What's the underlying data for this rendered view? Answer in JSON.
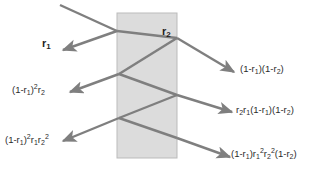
{
  "figure": {
    "slab": {
      "name": "slab",
      "fill_color": "#dcdcdc",
      "border_color": "#bbbbbb",
      "x": 117,
      "y": 13,
      "width": 60,
      "height": 145
    },
    "ray_color": "#7f7f7f",
    "ray_width": 2.4,
    "background_color": "#ffffff"
  },
  "labels": {
    "interface_r2": {
      "text": "r",
      "sub": "2",
      "x": 162,
      "y": 32
    },
    "reflected_1": {
      "text": "r",
      "sub": "1",
      "x": 42,
      "y": 44
    },
    "left_2": {
      "parts": "(1-r1)²r2",
      "x": 14,
      "y": 86
    },
    "left_3": {
      "parts": "(1-r1)²r1r2²",
      "x": 6,
      "y": 136
    },
    "right_1": {
      "parts": "(1-r1)(1-r2)",
      "x": 240,
      "y": 66
    },
    "right_2": {
      "parts": "r2r1(1-r1)(1-r2)",
      "x": 236,
      "y": 107
    },
    "right_3": {
      "parts": "(1-r1)r1²r2²(1-r2)",
      "x": 232,
      "y": 150
    }
  },
  "rays": [
    {
      "name": "incident-ray",
      "points": "60,5 117,31",
      "arrow": false
    },
    {
      "name": "reflected-ray-r1",
      "points": "117,31 63,50",
      "arrow": true
    },
    {
      "name": "refracted-ray-into-slab",
      "points": "117,31 177,38",
      "arrow": false
    },
    {
      "name": "transmitted-ray-1",
      "points": "177,38 234,72",
      "arrow": true
    },
    {
      "name": "internal-ray-back-to-front-1",
      "points": "177,38 119,74",
      "arrow": false
    },
    {
      "name": "exit-ray-left-2",
      "points": "119,74 70,92",
      "arrow": true
    },
    {
      "name": "internal-ray-front-to-back-2",
      "points": "119,74 177,95",
      "arrow": false
    },
    {
      "name": "transmitted-ray-2",
      "points": "177,95 232,112",
      "arrow": true
    },
    {
      "name": "internal-ray-back-to-front-2",
      "points": "177,95 119,118",
      "arrow": false
    },
    {
      "name": "exit-ray-left-3",
      "points": "119,118 63,141",
      "arrow": true
    },
    {
      "name": "internal-ray-front-to-back-3",
      "points": "119,118 177,138",
      "arrow": false
    },
    {
      "name": "transmitted-ray-3",
      "points": "177,138 230,157",
      "arrow": true
    }
  ],
  "expressions": {
    "left_2": [
      {
        "t": "(1-r",
        "k": "n"
      },
      {
        "t": "1",
        "k": "sub"
      },
      {
        "t": ")",
        "k": "n"
      },
      {
        "t": "2",
        "k": "sup"
      },
      {
        "t": "r",
        "k": "n"
      },
      {
        "t": "2",
        "k": "sub"
      }
    ],
    "left_3": [
      {
        "t": "(1-r",
        "k": "n"
      },
      {
        "t": "1",
        "k": "sub"
      },
      {
        "t": ")",
        "k": "n"
      },
      {
        "t": "2",
        "k": "sup"
      },
      {
        "t": "r",
        "k": "n"
      },
      {
        "t": "1",
        "k": "sub"
      },
      {
        "t": "r",
        "k": "n"
      },
      {
        "t": "2",
        "k": "sub"
      },
      {
        "t": "2",
        "k": "sup"
      }
    ],
    "right_1": [
      {
        "t": "(1-r",
        "k": "n"
      },
      {
        "t": "1",
        "k": "sub"
      },
      {
        "t": ")(1-r",
        "k": "n"
      },
      {
        "t": "2",
        "k": "sub"
      },
      {
        "t": ")",
        "k": "n"
      }
    ],
    "right_2": [
      {
        "t": "r",
        "k": "n"
      },
      {
        "t": "2",
        "k": "sub"
      },
      {
        "t": "r",
        "k": "n"
      },
      {
        "t": "1",
        "k": "sub"
      },
      {
        "t": "(1-r",
        "k": "n"
      },
      {
        "t": "1",
        "k": "sub"
      },
      {
        "t": ")(1-r",
        "k": "n"
      },
      {
        "t": "2",
        "k": "sub"
      },
      {
        "t": ")",
        "k": "n"
      }
    ],
    "right_3": [
      {
        "t": "(1-r",
        "k": "n"
      },
      {
        "t": "1",
        "k": "sub"
      },
      {
        "t": ")r",
        "k": "n"
      },
      {
        "t": "1",
        "k": "sub"
      },
      {
        "t": "2",
        "k": "sup"
      },
      {
        "t": "r",
        "k": "n"
      },
      {
        "t": "2",
        "k": "sub"
      },
      {
        "t": "2",
        "k": "sup"
      },
      {
        "t": "(1-r",
        "k": "n"
      },
      {
        "t": "2",
        "k": "sub"
      },
      {
        "t": ")",
        "k": "n"
      }
    ],
    "interface_r2": [
      {
        "t": "r",
        "k": "n"
      },
      {
        "t": "2",
        "k": "sub"
      }
    ],
    "reflected_1": [
      {
        "t": "r",
        "k": "n"
      },
      {
        "t": "1",
        "k": "sub"
      }
    ]
  }
}
